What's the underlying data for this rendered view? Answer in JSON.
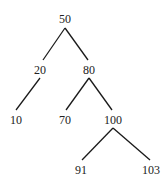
{
  "diagram": {
    "type": "binary-search-tree",
    "line_color": "#1a1a1a",
    "text_color": "#222222",
    "nodes": [
      {
        "id": "n50",
        "label": "50",
        "x": 65,
        "y": 19
      },
      {
        "id": "n20",
        "label": "20",
        "x": 40,
        "y": 70
      },
      {
        "id": "n80",
        "label": "80",
        "x": 89,
        "y": 70
      },
      {
        "id": "n10",
        "label": "10",
        "x": 16,
        "y": 120
      },
      {
        "id": "n70",
        "label": "70",
        "x": 65,
        "y": 120
      },
      {
        "id": "n100",
        "label": "100",
        "x": 113,
        "y": 120
      },
      {
        "id": "n91",
        "label": "91",
        "x": 81,
        "y": 170
      },
      {
        "id": "n103",
        "label": "103",
        "x": 151,
        "y": 170
      }
    ],
    "edges": [
      {
        "from": "n50",
        "to": "n20",
        "x1": 65,
        "y1": 28,
        "x2": 43,
        "y2": 60
      },
      {
        "from": "n50",
        "to": "n80",
        "x1": 65,
        "y1": 28,
        "x2": 88,
        "y2": 60
      },
      {
        "from": "n20",
        "to": "n10",
        "x1": 40,
        "y1": 78,
        "x2": 16,
        "y2": 110
      },
      {
        "from": "n80",
        "to": "n70",
        "x1": 89,
        "y1": 78,
        "x2": 66,
        "y2": 110
      },
      {
        "from": "n80",
        "to": "n100",
        "x1": 89,
        "y1": 78,
        "x2": 112,
        "y2": 110
      },
      {
        "from": "n100",
        "to": "n91",
        "x1": 113,
        "y1": 128,
        "x2": 82,
        "y2": 160
      },
      {
        "from": "n100",
        "to": "n103",
        "x1": 113,
        "y1": 128,
        "x2": 150,
        "y2": 160
      }
    ]
  }
}
